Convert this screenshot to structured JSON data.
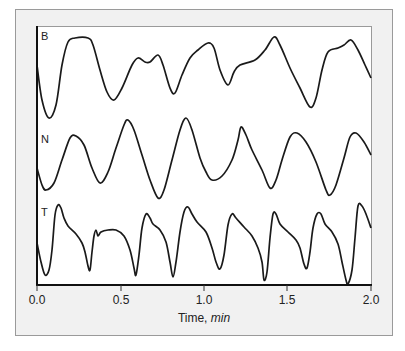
{
  "chart_data": {
    "type": "line",
    "title": "",
    "xlabel": "Time, min",
    "xlabel_parts": {
      "normal": "Time, ",
      "italic": "min"
    },
    "ylabel": "",
    "xlim": [
      0.0,
      2.0
    ],
    "x_ticks": [
      "0.0",
      "0.5",
      "1.0",
      "1.5",
      "2.0"
    ],
    "grid": false,
    "legend": "none",
    "series": [
      {
        "name": "B",
        "description": "irregular oscillation, top trace",
        "points_px": [
          [
            37,
            65
          ],
          [
            42,
            100
          ],
          [
            49,
            118
          ],
          [
            56,
            105
          ],
          [
            62,
            65
          ],
          [
            68,
            42
          ],
          [
            75,
            38
          ],
          [
            88,
            38
          ],
          [
            93,
            45
          ],
          [
            100,
            70
          ],
          [
            107,
            92
          ],
          [
            114,
            100
          ],
          [
            122,
            88
          ],
          [
            132,
            65
          ],
          [
            138,
            58
          ],
          [
            145,
            62
          ],
          [
            150,
            62
          ],
          [
            158,
            55
          ],
          [
            163,
            65
          ],
          [
            170,
            88
          ],
          [
            175,
            93
          ],
          [
            182,
            75
          ],
          [
            190,
            58
          ],
          [
            198,
            50
          ],
          [
            208,
            43
          ],
          [
            214,
            48
          ],
          [
            220,
            70
          ],
          [
            228,
            85
          ],
          [
            234,
            72
          ],
          [
            240,
            65
          ],
          [
            255,
            60
          ],
          [
            265,
            50
          ],
          [
            274,
            37
          ],
          [
            280,
            45
          ],
          [
            290,
            68
          ],
          [
            300,
            88
          ],
          [
            310,
            107
          ],
          [
            316,
            98
          ],
          [
            322,
            70
          ],
          [
            328,
            52
          ],
          [
            338,
            48
          ],
          [
            344,
            45
          ],
          [
            351,
            40
          ],
          [
            358,
            50
          ],
          [
            365,
            65
          ],
          [
            371,
            78
          ]
        ]
      },
      {
        "name": "N",
        "description": "near-regular oscillation, middle trace",
        "points_px": [
          [
            37,
            168
          ],
          [
            42,
            185
          ],
          [
            46,
            190
          ],
          [
            54,
            183
          ],
          [
            62,
            160
          ],
          [
            70,
            138
          ],
          [
            76,
            136
          ],
          [
            84,
            145
          ],
          [
            92,
            168
          ],
          [
            100,
            183
          ],
          [
            108,
            172
          ],
          [
            116,
            148
          ],
          [
            124,
            125
          ],
          [
            128,
            120
          ],
          [
            134,
            130
          ],
          [
            142,
            155
          ],
          [
            150,
            180
          ],
          [
            158,
            198
          ],
          [
            164,
            190
          ],
          [
            172,
            160
          ],
          [
            180,
            130
          ],
          [
            186,
            118
          ],
          [
            192,
            130
          ],
          [
            200,
            158
          ],
          [
            206,
            172
          ],
          [
            212,
            180
          ],
          [
            222,
            176
          ],
          [
            232,
            160
          ],
          [
            238,
            140
          ],
          [
            241,
            127
          ],
          [
            246,
            135
          ],
          [
            252,
            150
          ],
          [
            262,
            170
          ],
          [
            270,
            188
          ],
          [
            276,
            180
          ],
          [
            282,
            160
          ],
          [
            290,
            137
          ],
          [
            297,
            133
          ],
          [
            306,
            142
          ],
          [
            316,
            162
          ],
          [
            326,
            190
          ],
          [
            330,
            195
          ],
          [
            336,
            185
          ],
          [
            344,
            158
          ],
          [
            350,
            137
          ],
          [
            356,
            133
          ],
          [
            364,
            142
          ],
          [
            371,
            155
          ]
        ]
      },
      {
        "name": "T",
        "description": "relaxation-type oscillation with sharp dips, bottom trace",
        "points_px": [
          [
            37,
            243
          ],
          [
            41,
            262
          ],
          [
            45,
            275
          ],
          [
            49,
            270
          ],
          [
            52,
            250
          ],
          [
            55,
            215
          ],
          [
            58,
            205
          ],
          [
            61,
            208
          ],
          [
            64,
            218
          ],
          [
            68,
            226
          ],
          [
            76,
            234
          ],
          [
            82,
            243
          ],
          [
            85,
            252
          ],
          [
            88,
            266
          ],
          [
            90,
            270
          ],
          [
            92,
            252
          ],
          [
            94,
            236
          ],
          [
            96,
            230
          ],
          [
            98,
            236
          ],
          [
            101,
            232
          ],
          [
            108,
            230
          ],
          [
            116,
            230
          ],
          [
            124,
            236
          ],
          [
            130,
            250
          ],
          [
            134,
            268
          ],
          [
            136,
            275
          ],
          [
            139,
            255
          ],
          [
            142,
            228
          ],
          [
            146,
            214
          ],
          [
            150,
            218
          ],
          [
            153,
            224
          ],
          [
            160,
            230
          ],
          [
            166,
            242
          ],
          [
            170,
            262
          ],
          [
            173,
            277
          ],
          [
            176,
            262
          ],
          [
            180,
            232
          ],
          [
            184,
            212
          ],
          [
            188,
            207
          ],
          [
            192,
            214
          ],
          [
            197,
            222
          ],
          [
            206,
            232
          ],
          [
            212,
            248
          ],
          [
            216,
            262
          ],
          [
            220,
            269
          ],
          [
            224,
            255
          ],
          [
            228,
            225
          ],
          [
            232,
            214
          ],
          [
            236,
            218
          ],
          [
            244,
            227
          ],
          [
            252,
            236
          ],
          [
            258,
            248
          ],
          [
            262,
            262
          ],
          [
            264,
            280
          ],
          [
            267,
            272
          ],
          [
            270,
            238
          ],
          [
            273,
            214
          ],
          [
            276,
            214
          ],
          [
            280,
            224
          ],
          [
            288,
            232
          ],
          [
            296,
            240
          ],
          [
            300,
            248
          ],
          [
            304,
            264
          ],
          [
            307,
            268
          ],
          [
            310,
            252
          ],
          [
            313,
            228
          ],
          [
            317,
            214
          ],
          [
            321,
            214
          ],
          [
            325,
            224
          ],
          [
            332,
            232
          ],
          [
            338,
            244
          ],
          [
            342,
            262
          ],
          [
            346,
            280
          ],
          [
            348,
            284
          ],
          [
            352,
            270
          ],
          [
            355,
            238
          ],
          [
            358,
            206
          ],
          [
            362,
            206
          ],
          [
            366,
            214
          ],
          [
            371,
            228
          ]
        ]
      }
    ],
    "trace_labels": [
      "B",
      "N",
      "T"
    ]
  },
  "colors": {
    "frame_bg": "#f1f1f1",
    "frame_border": "#9a9a9a",
    "plot_bg": "#ffffff",
    "line": "#1a1a1a"
  }
}
